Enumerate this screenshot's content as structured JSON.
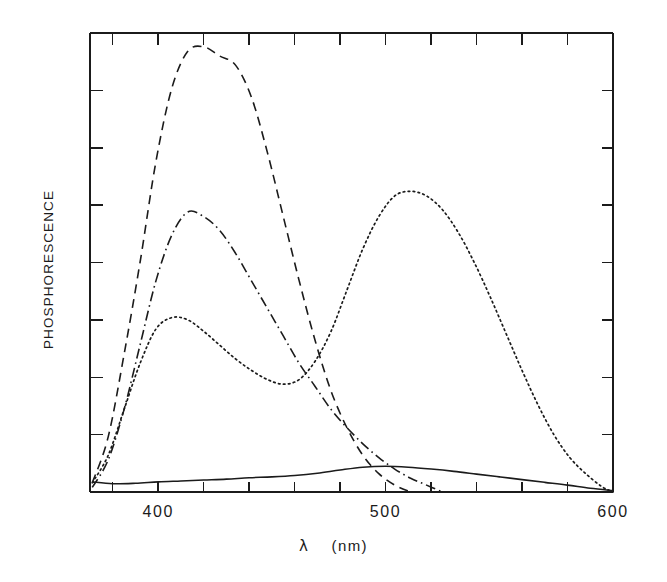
{
  "figure": {
    "ylabel": "PHOSPHORESCENCE",
    "xaxis_symbol": "λ",
    "xaxis_units": "(nm)",
    "xtick_labels": [
      "400",
      "500",
      "600"
    ]
  },
  "chart_data": {
    "type": "line",
    "title": "",
    "xlabel": "λ (nm)",
    "ylabel": "PHOSPHORESCENCE",
    "xlim": [
      370,
      600
    ],
    "ylim": [
      0,
      1.0
    ],
    "xticks": [
      400,
      500,
      600
    ],
    "xminor_tick_spacing": 20,
    "yticks_count": 8,
    "ytick_labels": [],
    "grid": false,
    "legend": false,
    "axes_frame": "box",
    "tick_direction": "in",
    "series": [
      {
        "name": "dashed-curve",
        "style": "dashed",
        "x": [
          371,
          378,
          385,
          392,
          399,
          406,
          413,
          420,
          427,
          434,
          441,
          448,
          455,
          462,
          469,
          476,
          483,
          490,
          497,
          504,
          511
        ],
        "values": [
          0.02,
          0.12,
          0.3,
          0.5,
          0.72,
          0.88,
          0.96,
          0.97,
          0.95,
          0.93,
          0.86,
          0.74,
          0.6,
          0.46,
          0.33,
          0.22,
          0.14,
          0.08,
          0.04,
          0.015,
          0.0
        ]
      },
      {
        "name": "dash-dot-curve",
        "style": "dashdot",
        "x": [
          371,
          378,
          385,
          392,
          399,
          406,
          413,
          420,
          427,
          434,
          441,
          448,
          455,
          462,
          469,
          476,
          483,
          490,
          497,
          504,
          511,
          518,
          525
        ],
        "values": [
          0.01,
          0.07,
          0.18,
          0.32,
          0.46,
          0.56,
          0.61,
          0.6,
          0.57,
          0.52,
          0.46,
          0.4,
          0.34,
          0.28,
          0.23,
          0.18,
          0.14,
          0.105,
          0.075,
          0.05,
          0.03,
          0.015,
          0.0
        ]
      },
      {
        "name": "dotted-curve",
        "style": "dotted",
        "x": [
          371,
          378,
          385,
          392,
          399,
          406,
          413,
          420,
          427,
          434,
          441,
          448,
          455,
          462,
          469,
          476,
          483,
          490,
          497,
          504,
          511,
          518,
          525,
          532,
          539,
          546,
          553,
          560,
          567,
          574,
          581,
          588,
          595,
          600
        ],
        "values": [
          0.02,
          0.08,
          0.18,
          0.28,
          0.355,
          0.38,
          0.375,
          0.35,
          0.32,
          0.29,
          0.265,
          0.245,
          0.235,
          0.245,
          0.285,
          0.35,
          0.44,
          0.53,
          0.6,
          0.645,
          0.655,
          0.645,
          0.615,
          0.565,
          0.5,
          0.425,
          0.345,
          0.265,
          0.19,
          0.125,
          0.075,
          0.04,
          0.012,
          0.0
        ]
      },
      {
        "name": "solid-baseline-curve",
        "style": "solid",
        "x": [
          371,
          380,
          390,
          400,
          410,
          420,
          430,
          440,
          450,
          460,
          470,
          480,
          490,
          500,
          510,
          520,
          530,
          540,
          550,
          560,
          570,
          580,
          590,
          600
        ],
        "values": [
          0.022,
          0.018,
          0.019,
          0.022,
          0.024,
          0.026,
          0.028,
          0.031,
          0.033,
          0.036,
          0.041,
          0.048,
          0.054,
          0.056,
          0.054,
          0.05,
          0.045,
          0.039,
          0.033,
          0.027,
          0.021,
          0.015,
          0.008,
          0.003
        ]
      }
    ]
  },
  "colors": {
    "ink": "#1b1b1b",
    "background": "#ffffff"
  }
}
